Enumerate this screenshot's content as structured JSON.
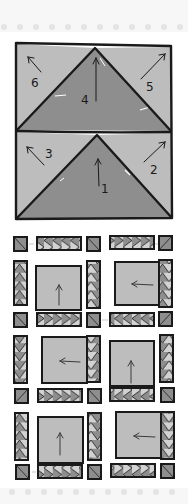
{
  "top_fragment": "",
  "colors": {
    "background": "#f7f7f7",
    "page": "#ffffff",
    "light_fill": "#bdbdbd",
    "dark_fill": "#8e8e8e",
    "outline": "#1a1a1a",
    "perforation": "#e4e4e4"
  },
  "flying_geese_block": {
    "units": [
      {
        "position": "top",
        "pieces": [
          {
            "label": "6",
            "shape": "left-corner-triangle",
            "arrow": "up-left"
          },
          {
            "label": "4",
            "shape": "center-triangle",
            "arrow": "up"
          },
          {
            "label": "5",
            "shape": "right-corner-triangle",
            "arrow": "up-right"
          }
        ]
      },
      {
        "position": "bottom",
        "pieces": [
          {
            "label": "3",
            "shape": "left-corner-triangle",
            "arrow": "up-left"
          },
          {
            "label": "1",
            "shape": "center-triangle",
            "arrow": "up"
          },
          {
            "label": "2",
            "shape": "right-corner-triangle",
            "arrow": "up-right"
          }
        ]
      }
    ]
  },
  "quilt_layout": {
    "block_arrows": [
      [
        "up",
        "left"
      ],
      [
        "left",
        "up"
      ],
      [
        "up",
        "left"
      ]
    ],
    "sashing_rows": 4,
    "cornerstones_per_row": 3
  }
}
